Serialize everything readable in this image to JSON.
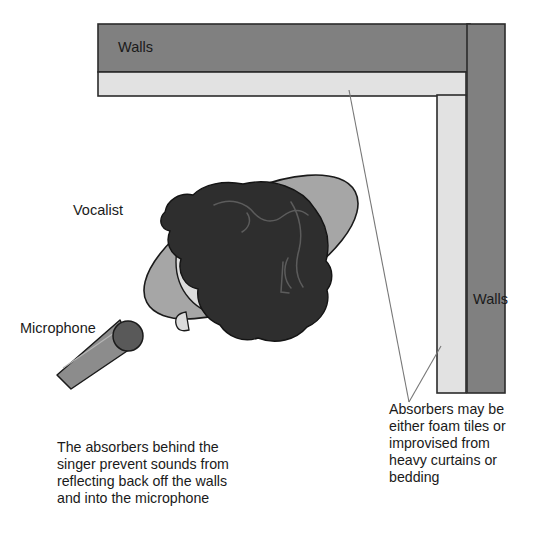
{
  "figure": {
    "background_color": "#ffffff"
  },
  "colors": {
    "wall_fill": "#808080",
    "wall_stroke": "#2b2b2b",
    "absorber_fill": "#e2e2e2",
    "absorber_stroke": "#2b2b2b",
    "shoulders_fill": "#a6a6a6",
    "shoulders_stroke": "#1a1a1a",
    "head_fill": "#dcdcdc",
    "hair_fill": "#2e2e2e",
    "hair_stroke": "#141414",
    "mic_body_fill": "#8c8c8c",
    "mic_head_fill": "#595959",
    "mic_stroke": "#1a1a1a",
    "leader_line": "#777777",
    "text": "#1a1a1a"
  },
  "walls": {
    "top": {
      "label": "Walls",
      "label_x": 118,
      "label_y": 48,
      "rect": {
        "x": 98,
        "y": 24,
        "width": 372,
        "height": 48
      }
    },
    "right": {
      "label": "Walls",
      "label_x": 473,
      "label_y": 300,
      "rect": {
        "x": 467,
        "y": 24,
        "width": 38,
        "height": 369
      }
    }
  },
  "absorbers": {
    "horizontal": {
      "x": 98,
      "y": 72,
      "width": 368,
      "height": 24
    },
    "vertical": {
      "x": 437,
      "y": 95,
      "width": 29,
      "height": 298
    }
  },
  "vocalist": {
    "label": "Vocalist",
    "label_x": 73,
    "label_y": 211,
    "shoulders": {
      "cx": 251,
      "cy": 247,
      "rx": 118,
      "ry": 52,
      "rotation_deg": -28
    },
    "head": {
      "cx": 222,
      "cy": 262,
      "rx": 46,
      "ry": 52
    }
  },
  "microphone": {
    "label": "Microphone",
    "label_x": 20,
    "label_y": 329,
    "head": {
      "cx": 128,
      "cy": 336,
      "r": 15
    },
    "handle": {
      "points": "118,321 131,348 70,388 57,376"
    }
  },
  "leader_lines": {
    "apex": {
      "x": 409,
      "y": 402
    },
    "to_horizontal_absorber": {
      "x": 349,
      "y": 90
    },
    "to_vertical_absorber": {
      "x": 441,
      "y": 346
    }
  },
  "notes": {
    "absorber_note": {
      "x": 389,
      "y": 414,
      "lines": [
        "Absorbers may be",
        "either foam tiles or",
        "improvised from",
        "heavy curtains or",
        "bedding"
      ]
    },
    "caption": {
      "x": 57,
      "y": 452,
      "lines": [
        "The absorbers behind the",
        "singer prevent sounds from",
        "reflecting back off the walls",
        "and into the microphone"
      ]
    }
  }
}
